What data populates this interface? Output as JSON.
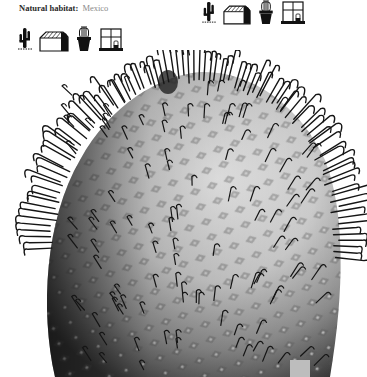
{
  "habitat": {
    "label": "Natural habitat:",
    "value": "Mexico"
  },
  "icons": {
    "left": [
      "cactus-outdoor-icon",
      "greenhouse-icon",
      "potted-cactus-icon",
      "windowsill-icon"
    ],
    "right": [
      "cactus-outdoor-icon",
      "greenhouse-icon",
      "potted-cactus-icon",
      "windowsill-icon"
    ]
  },
  "photo": {
    "subject": "cactus-photo",
    "description": "Black and white photograph of a globular cactus with hooked spines"
  },
  "colors": {
    "text_label": "#2a2a2a",
    "text_value": "#8a8a8a",
    "icon": "#111111",
    "background": "#ffffff"
  }
}
